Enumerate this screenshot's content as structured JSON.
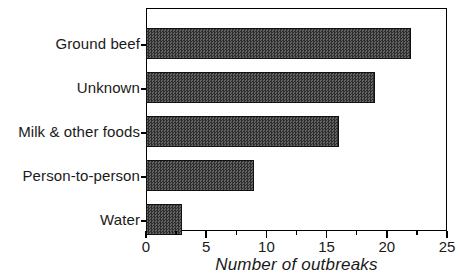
{
  "chart_data": {
    "type": "bar",
    "orientation": "horizontal",
    "title": "",
    "xlabel": "Number of outbreaks",
    "ylabel": "",
    "categories": [
      "Ground beef",
      "Unknown",
      "Milk & other foods",
      "Person-to-person",
      "Water"
    ],
    "values": [
      22,
      19,
      16,
      9,
      3
    ],
    "xlim": [
      0,
      25
    ],
    "xticks": [
      0,
      5,
      10,
      15,
      20,
      25
    ],
    "xtick_labels": [
      "0",
      "5",
      "10",
      "15",
      "20",
      "25"
    ],
    "minor_xticks": [
      2.5,
      7.5,
      12.5,
      17.5,
      22.5
    ],
    "grid": false,
    "legend": false,
    "bar_fill_color": "#4a4a4a",
    "bar_edge_color": "#111111",
    "frame_color": "#000000",
    "background_color": "#ffffff"
  },
  "axis": {
    "x_title": "Number of outbreaks",
    "tick_labels": [
      "0",
      "5",
      "10",
      "15",
      "20",
      "25"
    ],
    "category_labels": [
      "Ground beef",
      "Unknown",
      "Milk & other foods",
      "Person-to-person",
      "Water"
    ]
  }
}
